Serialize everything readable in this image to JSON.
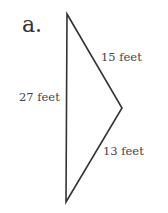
{
  "figure": {
    "part_label": "a.",
    "shape": "triangle",
    "sides": [
      {
        "id": "left",
        "label": "27 feet"
      },
      {
        "id": "upper-right",
        "label": "15 feet"
      },
      {
        "id": "lower-right",
        "label": "13 feet"
      }
    ],
    "stroke_color": "#333333"
  }
}
